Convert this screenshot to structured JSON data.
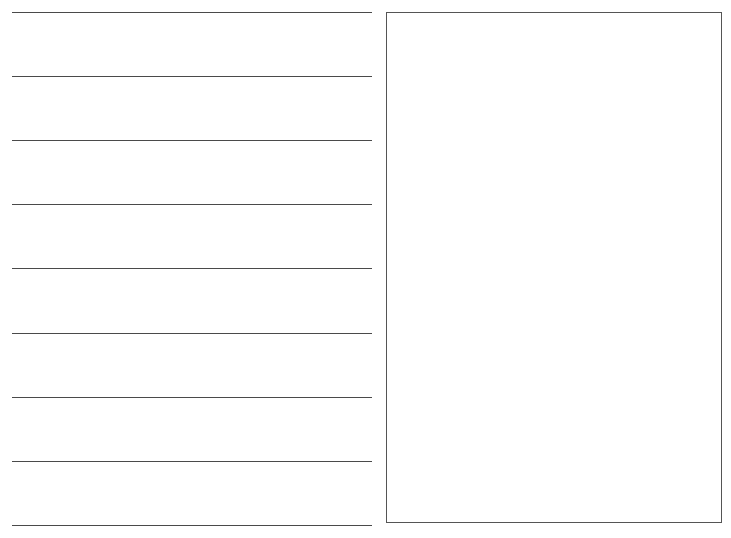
{
  "page": {
    "background": "#ffffff",
    "line_color": "#4a4a4a",
    "box_border_color": "#555555"
  },
  "writing_lines": {
    "count": 9,
    "y_positions": [
      12,
      76,
      140,
      204,
      268,
      333,
      397,
      461,
      525
    ],
    "x_start": 12,
    "x_end": 372
  },
  "drawing_box": {
    "left": 386,
    "top": 12,
    "right": 723,
    "bottom": 524,
    "content": ""
  }
}
